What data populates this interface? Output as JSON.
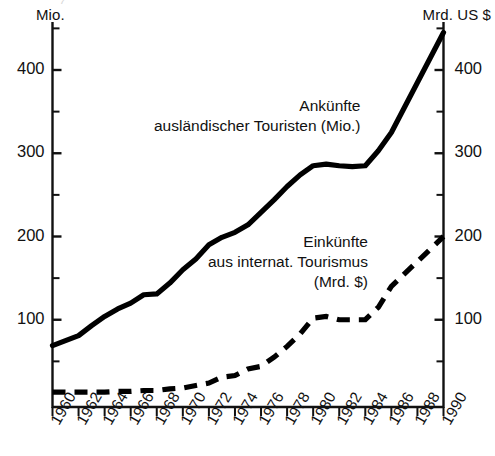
{
  "figure": {
    "left_axis_unit": "Mio.",
    "right_axis_unit": "Mrd. US $",
    "top_crop_text": "("
  },
  "annotations": {
    "arrivals": {
      "line1": "Ankünfte",
      "line2": "ausländischer Touristen (Mio.)"
    },
    "receipts": {
      "line1": "Einkünfte",
      "line2": "aus internat. Tourismus",
      "line3": "(Mrd. $)"
    }
  },
  "colors": {
    "ink": "#111111",
    "series_arrivals": "#000000",
    "series_receipts": "#000000",
    "background": "#ffffff"
  },
  "axes": {
    "left_ticks_major": [
      "100",
      "200",
      "300",
      "400"
    ],
    "right_ticks_major": [
      "100",
      "200",
      "300",
      "400"
    ],
    "left_ticks_minor": [
      "50",
      "150",
      "250",
      "350",
      "450"
    ],
    "y_min": 0,
    "y_max": 470,
    "x_min": 1960,
    "x_max": 1990,
    "x_tick_labels": [
      "1960",
      "1962",
      "1964",
      "1966",
      "1968",
      "1970",
      "1972",
      "1974",
      "1976",
      "1978",
      "1980",
      "1982",
      "1984",
      "1986",
      "1988",
      "1990"
    ]
  },
  "chart_data": {
    "type": "line",
    "title": "",
    "subtitle": "",
    "xlabel": "",
    "ylabel": "Mio.",
    "ylabel_right": "Mrd. US $",
    "ylim": [
      0,
      470
    ],
    "xlim": [
      1960,
      1990
    ],
    "grid": false,
    "legend": "inline annotations",
    "x": [
      1960,
      1961,
      1962,
      1963,
      1964,
      1965,
      1966,
      1967,
      1968,
      1969,
      1970,
      1971,
      1972,
      1973,
      1974,
      1975,
      1976,
      1977,
      1978,
      1979,
      1980,
      1981,
      1982,
      1983,
      1984,
      1985,
      1986,
      1987,
      1988,
      1989,
      1990
    ],
    "series": [
      {
        "name": "Ankünfte ausländischer Touristen (Mio.)",
        "unit": "Mio.",
        "axis": "left",
        "style": "solid",
        "values": [
          69,
          75,
          81,
          93,
          104,
          113,
          120,
          130,
          131,
          144,
          160,
          173,
          190,
          199,
          205,
          214,
          229,
          244,
          260,
          274,
          285,
          287,
          285,
          284,
          285,
          303,
          325,
          355,
          385,
          415,
          445
        ]
      },
      {
        "name": "Einkünfte aus internat. Tourismus (Mrd. $)",
        "unit": "Mrd. $",
        "axis": "right",
        "style": "dashed",
        "values": [
          13,
          13,
          13,
          13,
          13,
          14,
          14,
          15,
          15,
          17,
          18,
          21,
          24,
          31,
          33,
          41,
          44,
          55,
          68,
          83,
          102,
          104,
          100,
          100,
          100,
          115,
          140,
          155,
          170,
          185,
          200
        ]
      }
    ]
  }
}
